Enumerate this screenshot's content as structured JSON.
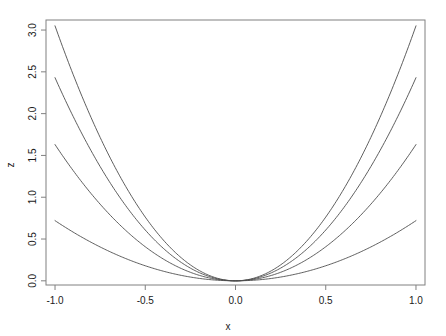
{
  "chart_data": {
    "type": "line",
    "title": "",
    "subtitle": "",
    "xlabel": "x",
    "ylabel": "z",
    "xlim": [
      -1.05,
      1.05
    ],
    "ylim": [
      -0.05,
      3.12
    ],
    "xticks": [
      -1.0,
      -0.5,
      0.0,
      0.5,
      1.0
    ],
    "xticklabels": [
      "-1.0",
      "-0.5",
      "0.0",
      "0.5",
      "1.0"
    ],
    "yticks": [
      0.0,
      0.5,
      1.0,
      1.5,
      2.0,
      2.5,
      3.0
    ],
    "yticklabels": [
      "0.0",
      "0.5",
      "1.0",
      "1.5",
      "2.0",
      "2.5",
      "3.0"
    ],
    "grid": false,
    "legend": false,
    "legend_position": "none",
    "box": true,
    "line_color": "#4d4d4d",
    "line_width": 0.9,
    "x": [
      -1.0,
      -0.9,
      -0.8,
      -0.7,
      -0.6,
      -0.5,
      -0.4,
      -0.3,
      -0.2,
      -0.1,
      0.0,
      0.1,
      0.2,
      0.3,
      0.4,
      0.5,
      0.6,
      0.7,
      0.8,
      0.9,
      1.0
    ],
    "series": [
      {
        "name": "z = 3.05 x^2",
        "coefficient": 3.05,
        "values": [
          3.05,
          2.47,
          1.952,
          1.4945,
          1.098,
          0.7625,
          0.488,
          0.2745,
          0.122,
          0.0305,
          0.0,
          0.0305,
          0.122,
          0.2745,
          0.488,
          0.7625,
          1.098,
          1.4945,
          1.952,
          2.47,
          3.05
        ]
      },
      {
        "name": "z = 2.43 x^2",
        "coefficient": 2.43,
        "values": [
          2.43,
          1.9683,
          1.5552,
          1.1907,
          0.8748,
          0.6075,
          0.3888,
          0.2187,
          0.0972,
          0.0243,
          0.0,
          0.0243,
          0.0972,
          0.2187,
          0.3888,
          0.6075,
          0.8748,
          1.1907,
          1.5552,
          1.9683,
          2.43
        ]
      },
      {
        "name": "z = 1.63 x^2",
        "coefficient": 1.63,
        "values": [
          1.63,
          1.3203,
          1.0432,
          0.7987,
          0.5868,
          0.4075,
          0.2608,
          0.1467,
          0.0652,
          0.0163,
          0.0,
          0.0163,
          0.0652,
          0.1467,
          0.2608,
          0.4075,
          0.5868,
          0.7987,
          1.0432,
          1.3203,
          1.63
        ]
      },
      {
        "name": "z = 0.72 x^2",
        "coefficient": 0.72,
        "values": [
          0.72,
          0.5832,
          0.4608,
          0.3528,
          0.2592,
          0.18,
          0.1152,
          0.0648,
          0.0288,
          0.0072,
          0.0,
          0.0072,
          0.0288,
          0.0648,
          0.1152,
          0.18,
          0.2592,
          0.3528,
          0.4608,
          0.5832,
          0.72
        ]
      }
    ]
  },
  "figure": {
    "background": "#ffffff",
    "axis_color": "#808080",
    "text_color": "#1a1a1a"
  }
}
